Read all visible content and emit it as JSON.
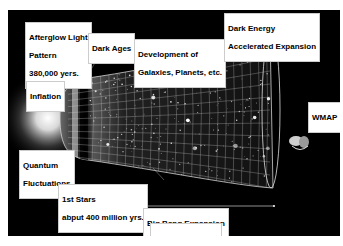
{
  "diagram": {
    "labels": {
      "afterglow": [
        "Afterglow Light",
        "Pattern",
        "380,000 yers."
      ],
      "dark_ages": [
        "Dark Ages"
      ],
      "development": [
        "Development of",
        "Galaxies, Planets, etc."
      ],
      "dark_energy": [
        "Dark Energy",
        "Accelerated Expansion"
      ],
      "inflation": [
        "Inflation"
      ],
      "quantum": [
        "Quantum",
        "Fluctuations"
      ],
      "wmap": [
        "WMAP"
      ],
      "first_stars": [
        "1st Stars",
        "abput 400 million yrs."
      ],
      "big_bang": [
        "Big Bang Expansion"
      ],
      "age": [
        "13.7 billion years"
      ]
    },
    "colors": {
      "background": "#000000",
      "label_bg": "#ffffff",
      "label_text": "#000000",
      "grid": "#d8d8d8"
    }
  }
}
